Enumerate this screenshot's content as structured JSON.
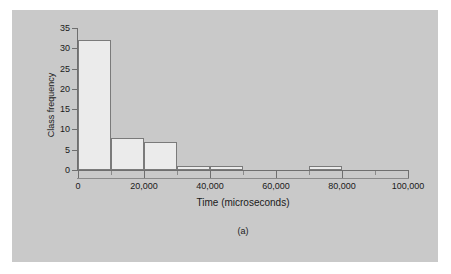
{
  "figure": {
    "caption": "(a)",
    "background_color": "#c9c9c9",
    "page_color": "#ffffff",
    "bar_fill_color": "#ebebeb",
    "bar_stroke_color": "#7a7a7a",
    "axis_color": "#6e6e6e"
  },
  "chart_data": {
    "type": "bar",
    "title": "",
    "subtitle": "",
    "xlabel": "Time (microseconds)",
    "ylabel": "Class frequency",
    "xlim": [
      0,
      100000
    ],
    "ylim": [
      0,
      35
    ],
    "grid": false,
    "legend": false,
    "bin_width": 10000,
    "xticks": [
      0,
      20000,
      40000,
      60000,
      80000,
      100000
    ],
    "xtick_labels": [
      "0",
      "20,000",
      "40,000",
      "60,000",
      "80,000",
      "100,000"
    ],
    "xticks_minor": [
      10000,
      30000,
      50000,
      70000,
      90000
    ],
    "yticks": [
      0,
      5,
      10,
      15,
      20,
      25,
      30,
      35
    ],
    "ytick_labels": [
      "0",
      "5",
      "10",
      "15",
      "20",
      "25",
      "30",
      "35"
    ],
    "bins": [
      {
        "x0": 0,
        "x1": 10000,
        "value": 32
      },
      {
        "x0": 10000,
        "x1": 20000,
        "value": 8
      },
      {
        "x0": 20000,
        "x1": 30000,
        "value": 7
      },
      {
        "x0": 30000,
        "x1": 40000,
        "value": 1
      },
      {
        "x0": 40000,
        "x1": 50000,
        "value": 1
      },
      {
        "x0": 50000,
        "x1": 60000,
        "value": 0
      },
      {
        "x0": 60000,
        "x1": 70000,
        "value": 0
      },
      {
        "x0": 70000,
        "x1": 80000,
        "value": 1
      },
      {
        "x0": 80000,
        "x1": 90000,
        "value": 0
      },
      {
        "x0": 90000,
        "x1": 100000,
        "value": 0
      }
    ],
    "categories": [
      "0-10,000",
      "10,000-20,000",
      "20,000-30,000",
      "30,000-40,000",
      "40,000-50,000",
      "50,000-60,000",
      "60,000-70,000",
      "70,000-80,000",
      "80,000-90,000",
      "90,000-100,000"
    ],
    "values": [
      32,
      8,
      7,
      1,
      1,
      0,
      0,
      1,
      0,
      0
    ]
  }
}
